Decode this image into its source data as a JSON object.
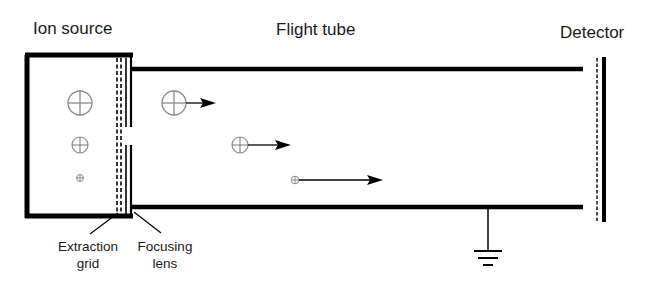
{
  "labels": {
    "ion_source": "Ion source",
    "flight_tube": "Flight tube",
    "detector": "Detector",
    "extraction_grid_line1": "Extraction",
    "extraction_grid_line2": "grid",
    "focusing_lens_line1": "Focusing",
    "focusing_lens_line2": "lens"
  },
  "ions": [
    {
      "name": "large-ion",
      "size": "large"
    },
    {
      "name": "medium-ion",
      "size": "medium"
    },
    {
      "name": "small-ion",
      "size": "small"
    }
  ],
  "colors": {
    "line": "#000000",
    "ion": "#8a8a8a",
    "text": "#1a1a1a"
  }
}
